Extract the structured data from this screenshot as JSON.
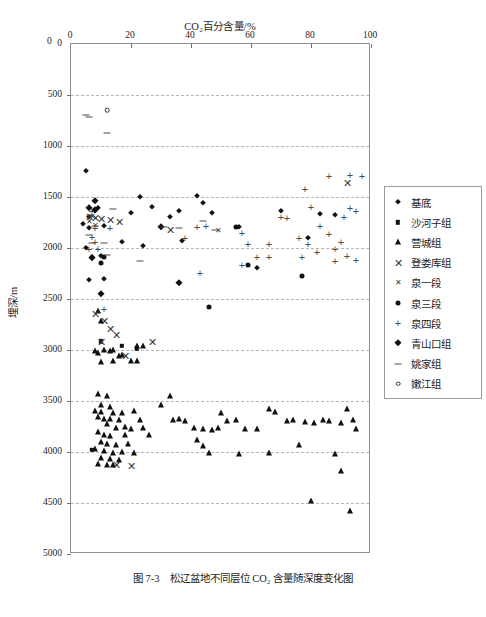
{
  "chart_data": {
    "type": "scatter",
    "title": "CO₂百分含量/%",
    "xlabel": "CO₂百分含量/%",
    "ylabel": "埋深/m",
    "xlim": [
      0,
      100
    ],
    "ylim": [
      0,
      5000
    ],
    "y_inverted": true,
    "grid": "horizontal-dashed",
    "legend_position": "right",
    "xticks": [
      0,
      20,
      40,
      60,
      80,
      100
    ],
    "yticks": [
      0,
      500,
      1000,
      1500,
      2000,
      2500,
      3000,
      3500,
      4000,
      4500,
      5000
    ],
    "origin_label": "0",
    "series": [
      {
        "name": "基底",
        "marker": "diamond",
        "points": [
          [
            5,
            1245
          ],
          [
            6,
            1700
          ],
          [
            4,
            1760
          ],
          [
            6,
            1800
          ],
          [
            8,
            1640
          ],
          [
            9,
            1610
          ],
          [
            11,
            1780
          ],
          [
            17,
            1940
          ],
          [
            20,
            1655
          ],
          [
            23,
            1500
          ],
          [
            27,
            1595
          ],
          [
            30,
            1790
          ],
          [
            33,
            1700
          ],
          [
            36,
            1640
          ],
          [
            42,
            1490
          ],
          [
            44,
            1560
          ],
          [
            47,
            1660
          ],
          [
            56,
            1790
          ],
          [
            62,
            2200
          ],
          [
            70,
            1640
          ],
          [
            79,
            1905
          ],
          [
            83,
            1670
          ],
          [
            88,
            1680
          ],
          [
            5,
            2000
          ],
          [
            7,
            2085
          ],
          [
            6,
            2310
          ],
          [
            11,
            2305
          ],
          [
            10,
            2075
          ],
          [
            24,
            1980
          ],
          [
            37,
            1930
          ]
        ]
      },
      {
        "name": "沙河子组",
        "marker": "square",
        "points": [
          [
            7,
            3980
          ],
          [
            10,
            2915
          ],
          [
            17,
            2960
          ],
          [
            22,
            2985
          ]
        ]
      },
      {
        "name": "营城组",
        "marker": "triangle",
        "points": [
          [
            9,
            2620
          ],
          [
            10,
            2720
          ],
          [
            13,
            3010
          ],
          [
            8,
            3010
          ],
          [
            9,
            3025
          ],
          [
            11,
            3000
          ],
          [
            14,
            3000
          ],
          [
            16,
            3055
          ],
          [
            17,
            3050
          ],
          [
            22,
            2960
          ],
          [
            24,
            2965
          ],
          [
            10,
            3120
          ],
          [
            14,
            3110
          ],
          [
            20,
            3105
          ],
          [
            22,
            3110
          ],
          [
            9,
            3430
          ],
          [
            12,
            3450
          ],
          [
            10,
            3540
          ],
          [
            13,
            3560
          ],
          [
            8,
            3600
          ],
          [
            10,
            3610
          ],
          [
            14,
            3620
          ],
          [
            17,
            3615
          ],
          [
            21,
            3600
          ],
          [
            9,
            3660
          ],
          [
            11,
            3675
          ],
          [
            13,
            3680
          ],
          [
            16,
            3690
          ],
          [
            23,
            3690
          ],
          [
            12,
            3730
          ],
          [
            15,
            3760
          ],
          [
            18,
            3755
          ],
          [
            20,
            3770
          ],
          [
            24,
            3765
          ],
          [
            9,
            3800
          ],
          [
            11,
            3830
          ],
          [
            13,
            3840
          ],
          [
            18,
            3835
          ],
          [
            26,
            3830
          ],
          [
            10,
            3900
          ],
          [
            12,
            3920
          ],
          [
            15,
            3930
          ],
          [
            19,
            3925
          ],
          [
            8,
            3975
          ],
          [
            11,
            3990
          ],
          [
            14,
            4010
          ],
          [
            17,
            4000
          ],
          [
            21,
            4010
          ],
          [
            10,
            4060
          ],
          [
            13,
            4070
          ],
          [
            16,
            4075
          ],
          [
            9,
            4120
          ],
          [
            12,
            4130
          ],
          [
            14,
            4125
          ],
          [
            34,
            3690
          ],
          [
            36,
            3680
          ],
          [
            38,
            3700
          ],
          [
            41,
            3760
          ],
          [
            44,
            3770
          ],
          [
            47,
            3785
          ],
          [
            49,
            3760
          ],
          [
            52,
            3700
          ],
          [
            55,
            3690
          ],
          [
            58,
            3770
          ],
          [
            42,
            3880
          ],
          [
            44,
            3940
          ],
          [
            46,
            4010
          ],
          [
            50,
            3620
          ],
          [
            62,
            3770
          ],
          [
            66,
            3575
          ],
          [
            72,
            3700
          ],
          [
            74,
            3690
          ],
          [
            78,
            3705
          ],
          [
            81,
            3715
          ],
          [
            84,
            3690
          ],
          [
            86,
            3700
          ],
          [
            90,
            3720
          ],
          [
            92,
            3580
          ],
          [
            94,
            3690
          ],
          [
            95,
            3770
          ],
          [
            88,
            4020
          ],
          [
            90,
            4190
          ],
          [
            80,
            4480
          ],
          [
            93,
            4580
          ],
          [
            30,
            3540
          ],
          [
            33,
            3455
          ],
          [
            56,
            4020
          ],
          [
            66,
            4005
          ],
          [
            76,
            3930
          ],
          [
            68,
            3610
          ]
        ]
      },
      {
        "name": "登娄库组",
        "marker": "x-large",
        "points": [
          [
            6,
            1700
          ],
          [
            8,
            1710
          ],
          [
            10,
            1715
          ],
          [
            13,
            1730
          ],
          [
            16,
            1745
          ],
          [
            8,
            2650
          ],
          [
            11,
            2720
          ],
          [
            13,
            2790
          ],
          [
            15,
            2850
          ],
          [
            10,
            2925
          ],
          [
            18,
            3060
          ],
          [
            15,
            4130
          ],
          [
            20,
            4140
          ],
          [
            27,
            2925
          ],
          [
            33,
            1825
          ],
          [
            92,
            1360
          ]
        ]
      },
      {
        "name": "泉一段",
        "marker": "x-small",
        "points": [
          [
            7,
            1700
          ],
          [
            6,
            1745
          ],
          [
            49,
            1835
          ],
          [
            8,
            1785
          ]
        ]
      },
      {
        "name": "泉三段",
        "marker": "circle",
        "points": [
          [
            11,
            2085
          ],
          [
            10,
            2145
          ],
          [
            46,
            2580
          ],
          [
            77,
            2275
          ],
          [
            55,
            1790
          ],
          [
            59,
            2170
          ]
        ]
      },
      {
        "name": "泉四段",
        "marker": "plus",
        "points": [
          [
            7,
            1640
          ],
          [
            8,
            1800
          ],
          [
            13,
            1800
          ],
          [
            7,
            1895
          ],
          [
            8,
            1945
          ],
          [
            6,
            2010
          ],
          [
            38,
            1900
          ],
          [
            42,
            1790
          ],
          [
            45,
            1785
          ],
          [
            57,
            1850
          ],
          [
            59,
            1960
          ],
          [
            62,
            2085
          ],
          [
            66,
            1960
          ],
          [
            70,
            1700
          ],
          [
            72,
            1705
          ],
          [
            76,
            1900
          ],
          [
            79,
            1960
          ],
          [
            83,
            1785
          ],
          [
            86,
            1860
          ],
          [
            88,
            2010
          ],
          [
            90,
            1945
          ],
          [
            91,
            1700
          ],
          [
            93,
            1610
          ],
          [
            95,
            1640
          ],
          [
            86,
            1290
          ],
          [
            93,
            1280
          ],
          [
            97,
            1290
          ],
          [
            66,
            2090
          ],
          [
            77,
            2090
          ],
          [
            82,
            2040
          ],
          [
            92,
            2075
          ],
          [
            95,
            2120
          ],
          [
            78,
            1425
          ],
          [
            88,
            2130
          ],
          [
            57,
            2170
          ],
          [
            43,
            2245
          ],
          [
            80,
            1600
          ],
          [
            11,
            2600
          ],
          [
            9,
            2010
          ]
        ]
      },
      {
        "name": "青山口组",
        "marker": "diamond-solid",
        "points": [
          [
            8,
            1540
          ],
          [
            6,
            1610
          ],
          [
            8,
            1630
          ],
          [
            30,
            1790
          ],
          [
            7,
            2100
          ],
          [
            10,
            2450
          ],
          [
            36,
            2345
          ]
        ]
      },
      {
        "name": "姚家组",
        "marker": "dash",
        "points": [
          [
            5,
            700
          ],
          [
            6,
            715
          ],
          [
            12,
            875
          ],
          [
            14,
            1620
          ],
          [
            6,
            1870
          ],
          [
            7,
            1950
          ],
          [
            11,
            1950
          ],
          [
            23,
            2130
          ],
          [
            31,
            1790
          ],
          [
            36,
            1805
          ],
          [
            44,
            1740
          ],
          [
            48,
            1820
          ],
          [
            8,
            1785
          ],
          [
            12,
            2065
          ]
        ]
      },
      {
        "name": "嫩江组",
        "marker": "open-circle",
        "points": [
          [
            12,
            650
          ]
        ]
      }
    ]
  },
  "legend": {
    "items": [
      {
        "label": "基底",
        "marker": "diamond"
      },
      {
        "label": "沙河子组",
        "marker": "square"
      },
      {
        "label": "营城组",
        "marker": "triangle"
      },
      {
        "label": "登娄库组",
        "marker": "x-large"
      },
      {
        "label": "泉一段",
        "marker": "x-small"
      },
      {
        "label": "泉三段",
        "marker": "circle"
      },
      {
        "label": "泉四段",
        "marker": "plus"
      },
      {
        "label": "青山口组",
        "marker": "diamond-solid"
      },
      {
        "label": "姚家组",
        "marker": "dash"
      },
      {
        "label": "嫩江组",
        "marker": "open-circle"
      }
    ]
  },
  "caption": {
    "number": "图 7-3",
    "text": "松辽盆地不同层位 CO₂ 含量随深度变化图",
    "full": "图 7-3　松辽盆地不同层位 CO₂ 含量随深度变化图"
  }
}
